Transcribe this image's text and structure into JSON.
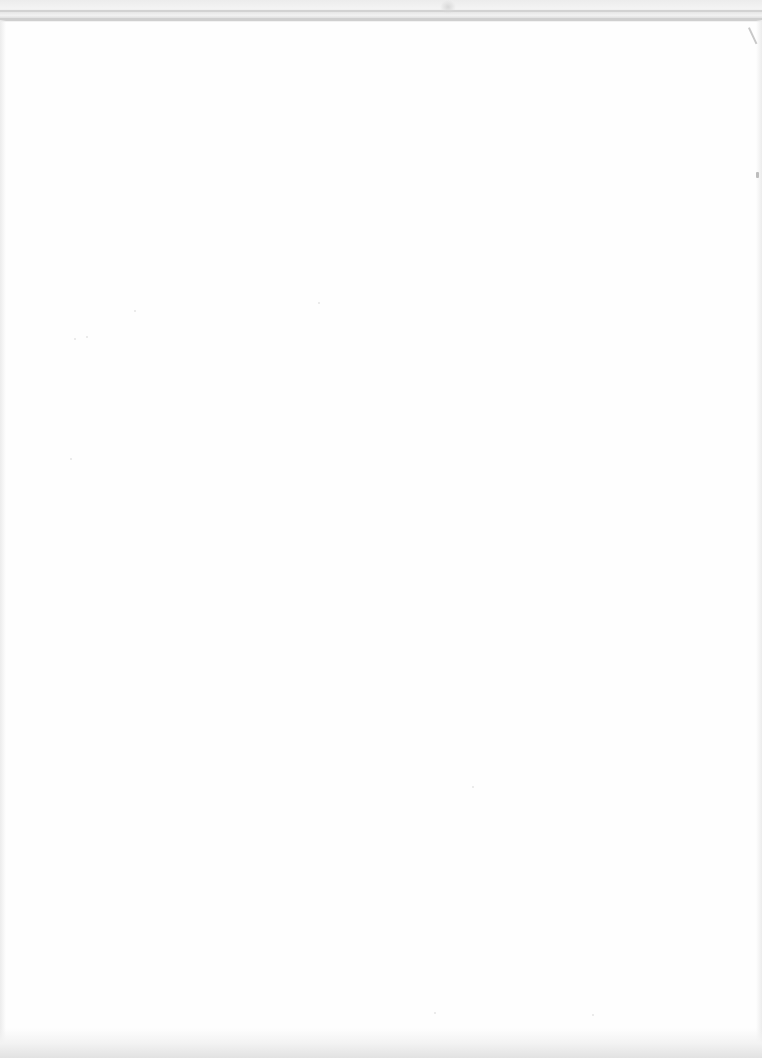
{
  "page": {
    "type": "blank-scanned-page",
    "background_color": "#fefefe",
    "top_rule_color": "#d2d2d2",
    "edge_shade_color": "#e2e2e2"
  }
}
